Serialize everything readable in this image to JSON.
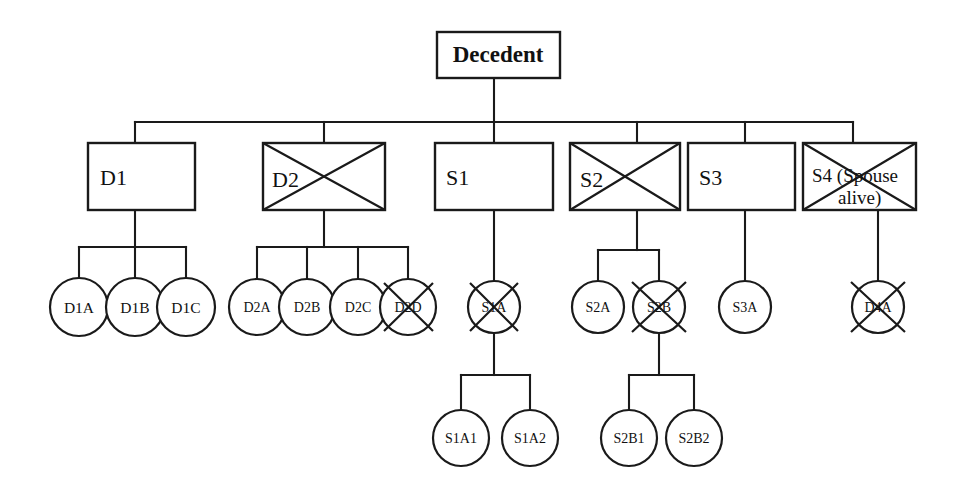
{
  "diagram": {
    "type": "genealogy-tree",
    "stroke_color": "#1a1a1a",
    "background_color": "#ffffff",
    "legend": {
      "deceased_marker": "X through shape",
      "box_shape": "rectangle = child of decedent",
      "circle_shape": "circle = grandchild / great-grandchild"
    },
    "root": {
      "label": "Decedent",
      "shape": "box",
      "deceased": false
    },
    "generation_2": [
      {
        "label": "D1",
        "shape": "box",
        "deceased": false
      },
      {
        "label": "D2",
        "shape": "box",
        "deceased": true
      },
      {
        "label": "S1",
        "shape": "box",
        "deceased": false
      },
      {
        "label": "S2",
        "shape": "box",
        "deceased": true
      },
      {
        "label": "S3",
        "shape": "box",
        "deceased": false
      },
      {
        "label": "S4 (Spouse alive)",
        "shape": "box",
        "deceased": true
      }
    ],
    "generation_3": [
      {
        "label": "D1A",
        "shape": "circle",
        "deceased": false,
        "parent": "D1"
      },
      {
        "label": "D1B",
        "shape": "circle",
        "deceased": false,
        "parent": "D1"
      },
      {
        "label": "D1C",
        "shape": "circle",
        "deceased": false,
        "parent": "D1"
      },
      {
        "label": "D2A",
        "shape": "circle",
        "deceased": false,
        "parent": "D2"
      },
      {
        "label": "D2B",
        "shape": "circle",
        "deceased": false,
        "parent": "D2"
      },
      {
        "label": "D2C",
        "shape": "circle",
        "deceased": false,
        "parent": "D2"
      },
      {
        "label": "D2D",
        "shape": "circle",
        "deceased": true,
        "parent": "D2"
      },
      {
        "label": "S1A",
        "shape": "circle",
        "deceased": true,
        "parent": "S1"
      },
      {
        "label": "S2A",
        "shape": "circle",
        "deceased": false,
        "parent": "S2"
      },
      {
        "label": "S2B",
        "shape": "circle",
        "deceased": true,
        "parent": "S2"
      },
      {
        "label": "S3A",
        "shape": "circle",
        "deceased": false,
        "parent": "S3"
      },
      {
        "label": "D4A",
        "shape": "circle",
        "deceased": true,
        "parent": "S4 (Spouse alive)"
      }
    ],
    "generation_4": [
      {
        "label": "S1A1",
        "shape": "circle",
        "deceased": false,
        "parent": "S1A"
      },
      {
        "label": "S1A2",
        "shape": "circle",
        "deceased": false,
        "parent": "S1A"
      },
      {
        "label": "S2B1",
        "shape": "circle",
        "deceased": false,
        "parent": "S2B"
      },
      {
        "label": "S2B2",
        "shape": "circle",
        "deceased": false,
        "parent": "S2B"
      }
    ]
  }
}
